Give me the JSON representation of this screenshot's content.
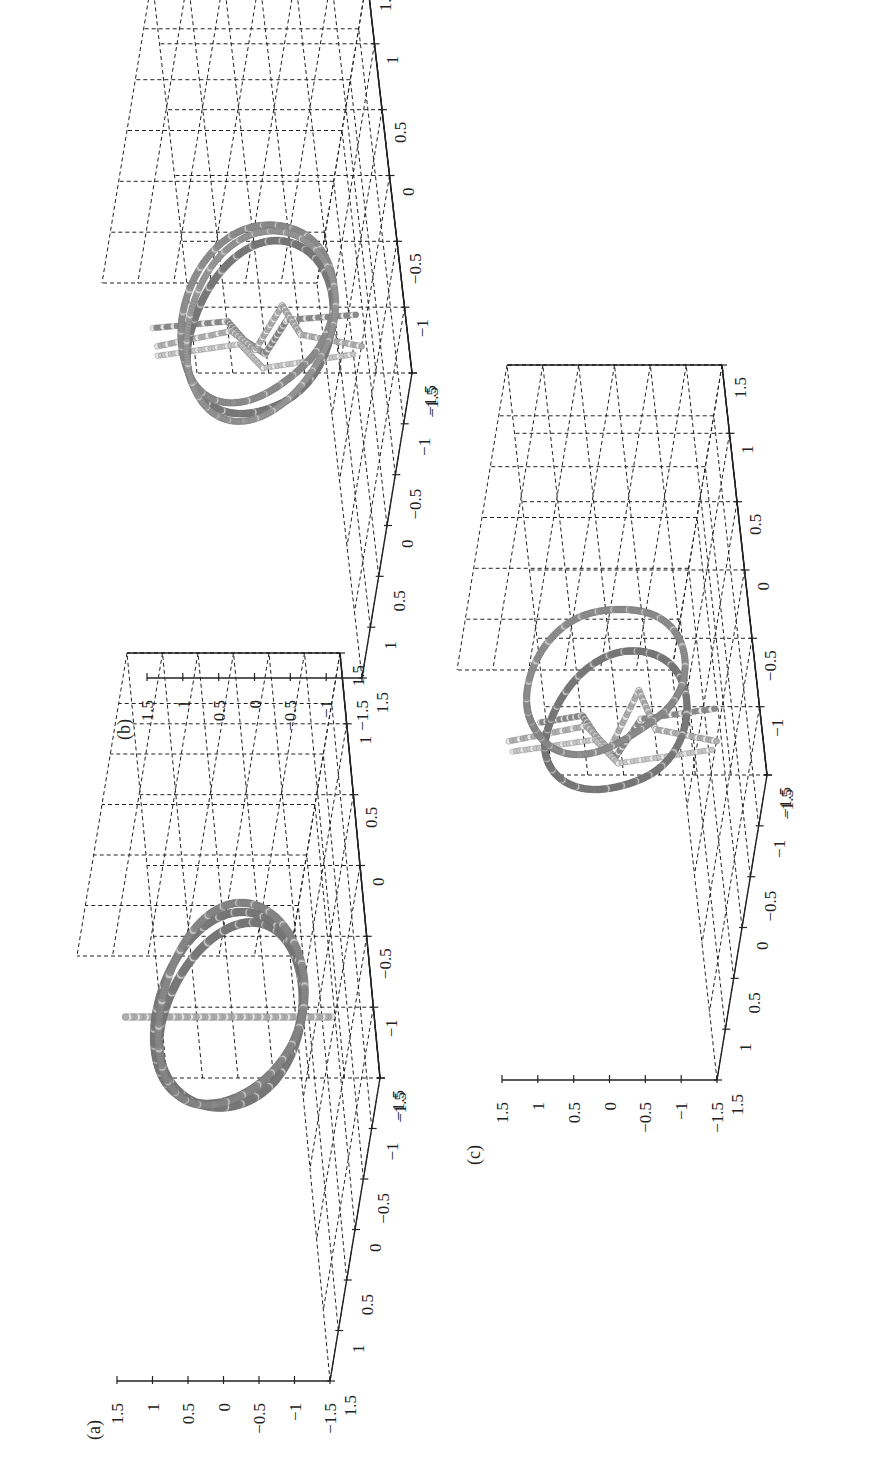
{
  "figure": {
    "orientation": "rotated 90 degrees counter-clockwise (landscape page)",
    "caption_visible": "",
    "panels": [
      {
        "label": "(a)"
      },
      {
        "label": "(b)"
      },
      {
        "label": "(c)"
      }
    ]
  },
  "chart_data": [
    {
      "type": "scatter",
      "title": "(a)",
      "subtitle": "3D scatter: ring (torus-like loop) with a straight rod passing through its center",
      "xlabel": "",
      "ylabel": "",
      "zlabel": "",
      "xlim": [
        -1.5,
        1.5
      ],
      "ylim": [
        -1.5,
        1.5
      ],
      "zlim": [
        -1.5,
        1.5
      ],
      "x_ticks": [
        "-1.5",
        "-1",
        "-0.5",
        "0",
        "0.5",
        "1",
        "1.5"
      ],
      "y_ticks": [
        "-1.5",
        "-1",
        "-0.5",
        "0",
        "0.5",
        "1",
        "1.5"
      ],
      "z_ticks": [
        "-1.5",
        "-1",
        "-0.5",
        "0",
        "0.5",
        "1",
        "1.5"
      ],
      "grid": true,
      "series": [
        {
          "name": "ring",
          "shape": "closed loop, radius ~1, dense dark-gray markers",
          "color": "#7a7a7a"
        },
        {
          "name": "rod",
          "shape": "straight line through ring center, length ~3, light-gray markers",
          "color": "#b0b0b0"
        }
      ]
    },
    {
      "type": "scatter",
      "title": "(b)",
      "subtitle": "3D scatter: deformed ring with crossing rods that bend near center",
      "xlabel": "",
      "ylabel": "",
      "zlabel": "",
      "xlim": [
        -1.5,
        1.5
      ],
      "ylim": [
        -1.5,
        1.5
      ],
      "zlim": [
        -1.5,
        1.5
      ],
      "x_ticks": [
        "-1.5",
        "-1",
        "-0.5",
        "0",
        "0.5",
        "1",
        "1.5"
      ],
      "y_ticks": [
        "-1.5",
        "-1",
        "-0.5",
        "0",
        "0.5",
        "1",
        "1.5"
      ],
      "z_ticks": [
        "-1.5",
        "-1",
        "-0.5",
        "0",
        "0.5",
        "1",
        "1.5"
      ],
      "grid": true,
      "series": [
        {
          "name": "ring",
          "shape": "double-stranded loop, radius ~1",
          "color": "#7a7a7a"
        },
        {
          "name": "rods",
          "shape": "two rods crossing the ring with a kinked loop near center",
          "color": "#b5b5b5"
        }
      ]
    },
    {
      "type": "scatter",
      "title": "(c)",
      "subtitle": "3D scatter: ring strands separating, rods with pronounced central kink",
      "xlabel": "",
      "ylabel": "",
      "zlabel": "",
      "xlim": [
        -1.5,
        1.5
      ],
      "ylim": [
        -1.5,
        1.5
      ],
      "zlim": [
        -1.5,
        1.5
      ],
      "x_ticks": [
        "-1.5",
        "-1",
        "-0.5",
        "0",
        "0.5",
        "1",
        "1.5"
      ],
      "y_ticks": [
        "-1.5",
        "-1",
        "-0.5",
        "0",
        "0.5",
        "1",
        "1.5"
      ],
      "z_ticks": [
        "-1.5",
        "-1",
        "-0.5",
        "0",
        "0.5",
        "1",
        "1.5"
      ],
      "grid": true,
      "series": [
        {
          "name": "ring",
          "shape": "two separated loops, radius ~1",
          "color": "#7a7a7a"
        },
        {
          "name": "rods",
          "shape": "crossing rods with a hairpin kink at center",
          "color": "#b5b5b5"
        }
      ]
    }
  ],
  "ticks": {
    "z": [
      "1.5",
      "1",
      "0.5",
      "0",
      "−0.5",
      "−1",
      "−1.5"
    ],
    "x": [
      "1.5",
      "1",
      "0.5",
      "0",
      "−0.5",
      "−1",
      "−1.5"
    ],
    "y": [
      "−1.5",
      "−1",
      "−0.5",
      "0",
      "0.5",
      "1",
      "1.5"
    ]
  },
  "colors": {
    "axis": "#222222",
    "ring": "#7a7a7a",
    "ring_highlight": "#d0d0d0",
    "rod": "#b0b0b0",
    "background": "#ffffff"
  }
}
